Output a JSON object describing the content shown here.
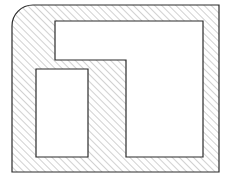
{
  "figure": {
    "canvas": {
      "width": 229,
      "height": 181,
      "background": "#ffffff"
    },
    "style": {
      "outline_color": "#2b2b2b",
      "outline_width": 1.2,
      "hatch_color": "#9a9a9a",
      "hatch_width": 0.9,
      "hatch_spacing": 5,
      "hatch_angle_deg": 45,
      "cutout_fill": "#ffffff"
    },
    "outer_boundary": {
      "name": "hatched-body-outline",
      "left": 12,
      "top": 5,
      "right": 219,
      "bottom": 172,
      "corner_radius_top_left": 21,
      "corner_radius_top_right": 0,
      "corner_radius_bottom_right": 0,
      "corner_radius_bottom_left": 0,
      "path": "M 33 5 L 219 5 L 219 172 L 12 172 L 12 26 A 21 21 0 0 1 33 5 Z"
    },
    "cutouts": [
      {
        "name": "large-l-cutout",
        "shape": "L-shaped",
        "path": "M 55 21 L 203 21 L 203 157 L 126 157 L 126 60 L 55 60 Z",
        "vertices": [
          [
            55,
            21
          ],
          [
            203,
            21
          ],
          [
            203,
            157
          ],
          [
            126,
            157
          ],
          [
            126,
            60
          ],
          [
            55,
            60
          ]
        ]
      },
      {
        "name": "small-rect-cutout",
        "shape": "rectangle",
        "path": "M 36 69 L 88 69 L 88 157 L 36 157 Z",
        "left": 36,
        "top": 69,
        "right": 88,
        "bottom": 157,
        "width": 52,
        "height": 88
      }
    ]
  }
}
